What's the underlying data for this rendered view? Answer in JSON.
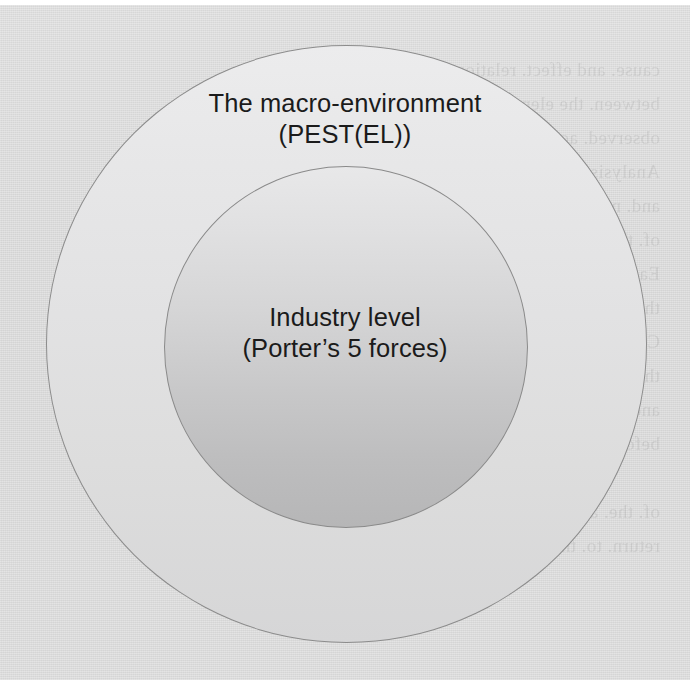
{
  "diagram": {
    "type": "concentric-circles",
    "title_visible": false,
    "outer_ring": {
      "label_line1": "The macro-environment",
      "label_line2": "(PEST(EL))",
      "fill_color": "#e4e4e5",
      "outline_color": "#8c8c8c",
      "center": {
        "x": 347,
        "y": 344
      },
      "diameter": 600
    },
    "inner_circle": {
      "label_line1": "Industry level",
      "label_line2": "(Porter’s 5 forces)",
      "fill_color": "#cfcfd0",
      "outline_color": "#8a8a8a",
      "center": {
        "x": 346,
        "y": 347
      },
      "diameter": 362
    }
  },
  "page": {
    "background_color": "#dcdcdc",
    "medium": "scanned-book-page",
    "showthrough_text": "cause. and effect. relationships\nbetween. the elements. and. outcomes\nobserved. across. the. wider. setting.\nAnalysis. begins. at. the. outer. level.\nand. narrows. towards. the. centre.\nof. the. framework. shown. here.\nEach. successive. layer. adds. detail.\nthat. refines. the. strategic. picture.\nConsider. the. forces. acting. upon.\nthe. organisation. at. every. stage.\nand. record. the. findings. carefully\nbefore. moving. to. the. next. step.\n\nof. the. analysis. the. reader. should\nreturn. to. the. opening. questions."
  }
}
